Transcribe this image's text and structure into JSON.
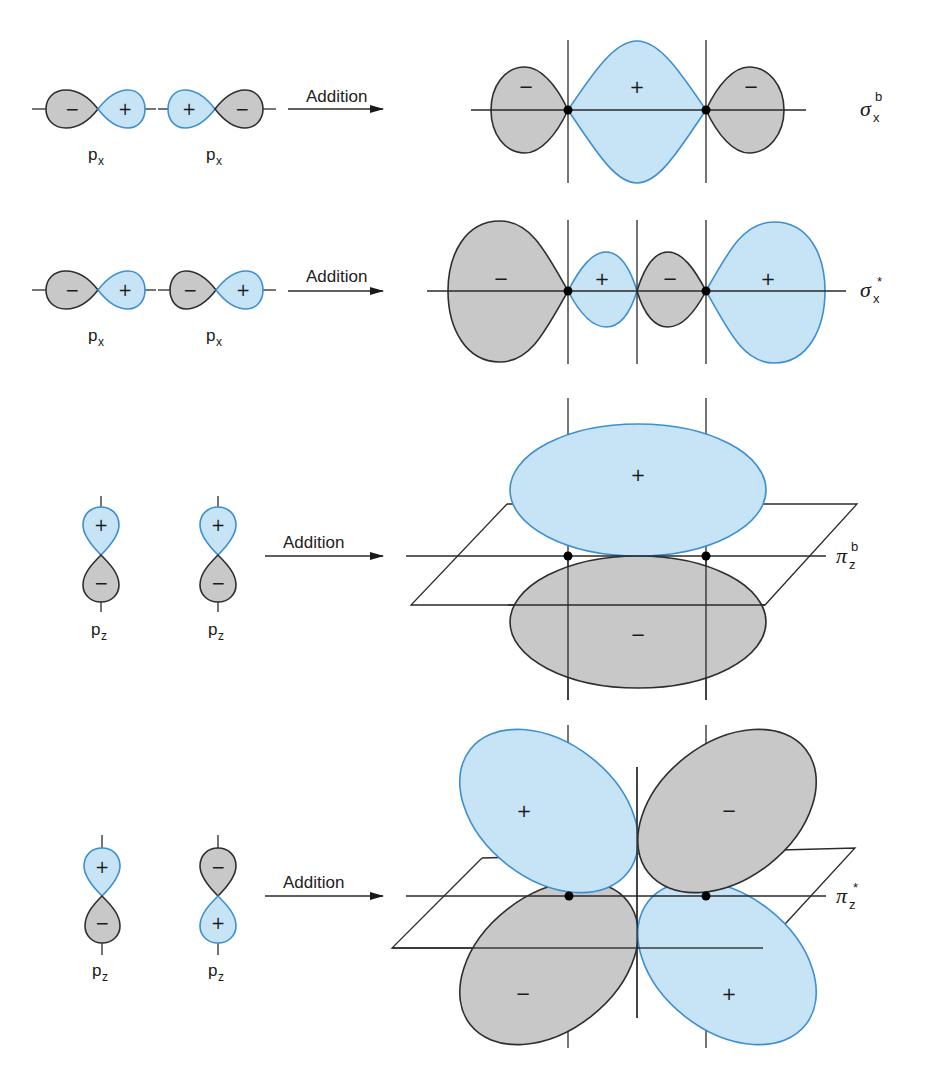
{
  "colors": {
    "positive_fill": "#c7e4f6",
    "positive_stroke": "#3d8fd0",
    "negative_fill": "#c8c8c8",
    "negative_stroke": "#2e2e2e",
    "line": "#2a2a2a"
  },
  "signs": {
    "plus": "+",
    "minus": "−"
  },
  "arrow_label": "Addition",
  "rows": [
    {
      "id": "sigma-bonding",
      "inputs": [
        {
          "label": "p",
          "sub": "x",
          "lobes": [
            "-",
            "+"
          ]
        },
        {
          "label": "p",
          "sub": "x",
          "lobes": [
            "+",
            "-"
          ]
        }
      ],
      "arrow_label": "Addition",
      "result": {
        "symbol": "σ",
        "sub": "x",
        "sup": "b",
        "lobe_signs": [
          "−",
          "+",
          "−"
        ]
      }
    },
    {
      "id": "sigma-antibonding",
      "inputs": [
        {
          "label": "p",
          "sub": "x",
          "lobes": [
            "-",
            "+"
          ]
        },
        {
          "label": "p",
          "sub": "x",
          "lobes": [
            "-",
            "+"
          ]
        }
      ],
      "arrow_label": "Addition",
      "result": {
        "symbol": "σ",
        "sub": "x",
        "sup": "*",
        "lobe_signs": [
          "−",
          "+",
          "−",
          "+"
        ]
      }
    },
    {
      "id": "pi-bonding",
      "inputs": [
        {
          "label": "p",
          "sub": "z",
          "lobes": [
            "+",
            "-"
          ]
        },
        {
          "label": "p",
          "sub": "z",
          "lobes": [
            "+",
            "-"
          ]
        }
      ],
      "arrow_label": "Addition",
      "result": {
        "symbol": "π",
        "sub": "z",
        "sup": "b",
        "lobe_signs": [
          "+",
          "−"
        ]
      }
    },
    {
      "id": "pi-antibonding",
      "inputs": [
        {
          "label": "p",
          "sub": "z",
          "lobes": [
            "+",
            "-"
          ]
        },
        {
          "label": "p",
          "sub": "z",
          "lobes": [
            "-",
            "+"
          ]
        }
      ],
      "arrow_label": "Addition",
      "result": {
        "symbol": "π",
        "sub": "z",
        "sup": "*",
        "lobe_signs": [
          "+",
          "−",
          "−",
          "+"
        ]
      }
    }
  ]
}
